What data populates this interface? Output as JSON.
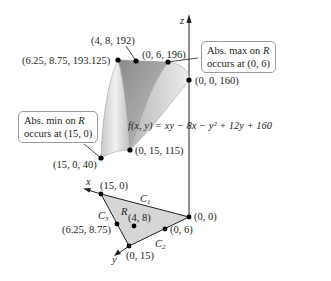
{
  "figure": {
    "function_label": "f(x, y) = xy − 8x − y² + 12y + 160",
    "axes": {
      "x": "x",
      "y": "y",
      "z": "z"
    },
    "callouts": {
      "max": {
        "line1_pre": "Abs. max on ",
        "line1_var": "R",
        "line2": "occurs at (0, 6)"
      },
      "min": {
        "line1_pre": "Abs. min on ",
        "line1_var": "R",
        "line2": "occurs at (15, 0)"
      }
    },
    "surface_points": [
      {
        "name": "p-6.25-8.75",
        "label": "(6.25, 8.75, 193.125)"
      },
      {
        "name": "p-4-8",
        "label": "(4, 8, 192)"
      },
      {
        "name": "p-0-6",
        "label": "(0, 6, 196)"
      },
      {
        "name": "p-0-0",
        "label": "(0, 0, 160)"
      },
      {
        "name": "p-0-15",
        "label": "(0, 15, 115)"
      },
      {
        "name": "p-15-0",
        "label": "(15, 0, 40)"
      }
    ],
    "region": {
      "label": "R",
      "curves": {
        "c1": "C",
        "c2": "C",
        "c3": "C",
        "c1_sub": "1",
        "c2_sub": "2",
        "c3_sub": "3"
      },
      "points": [
        {
          "name": "r-15-0",
          "label": "(15, 0)"
        },
        {
          "name": "r-0-0",
          "label": "(0, 0)"
        },
        {
          "name": "r-0-15",
          "label": "(0, 15)"
        },
        {
          "name": "r-0-6",
          "label": "(0, 6)"
        },
        {
          "name": "r-6.25-8.75",
          "label": "(6.25, 8.75)"
        },
        {
          "name": "r-4-8",
          "label": "(4, 8)"
        }
      ]
    },
    "colors": {
      "surface_dark": "#8f8f8f",
      "surface_light": "#e6e6e6",
      "region_fill": "#d4d4d4",
      "ink": "#231f20"
    }
  }
}
